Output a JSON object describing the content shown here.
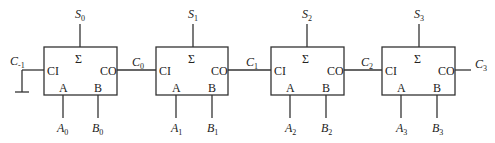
{
  "diagram": {
    "carry_in": {
      "base": "C",
      "sub": "-1"
    },
    "adders": [
      {
        "sum": {
          "base": "S",
          "sub": "0"
        },
        "a": {
          "base": "A",
          "sub": "0"
        },
        "b": {
          "base": "B",
          "sub": "0"
        },
        "cout": {
          "base": "C",
          "sub": "0"
        },
        "pins": {
          "sigma": "Σ",
          "ci": "CI",
          "co": "CO",
          "a": "A",
          "b": "B"
        }
      },
      {
        "sum": {
          "base": "S",
          "sub": "1"
        },
        "a": {
          "base": "A",
          "sub": "1"
        },
        "b": {
          "base": "B",
          "sub": "1"
        },
        "cout": {
          "base": "C",
          "sub": "1"
        },
        "pins": {
          "sigma": "Σ",
          "ci": "CI",
          "co": "CO",
          "a": "A",
          "b": "B"
        }
      },
      {
        "sum": {
          "base": "S",
          "sub": "2"
        },
        "a": {
          "base": "A",
          "sub": "2"
        },
        "b": {
          "base": "B",
          "sub": "2"
        },
        "cout": {
          "base": "C",
          "sub": "2"
        },
        "pins": {
          "sigma": "Σ",
          "ci": "CI",
          "co": "CO",
          "a": "A",
          "b": "B"
        }
      },
      {
        "sum": {
          "base": "S",
          "sub": "3"
        },
        "a": {
          "base": "A",
          "sub": "3"
        },
        "b": {
          "base": "B",
          "sub": "3"
        },
        "cout": {
          "base": "C",
          "sub": "3"
        },
        "pins": {
          "sigma": "Σ",
          "ci": "CI",
          "co": "CO",
          "a": "A",
          "b": "B"
        }
      }
    ],
    "colors": {
      "line": "#333333",
      "background": "#ffffff"
    }
  }
}
